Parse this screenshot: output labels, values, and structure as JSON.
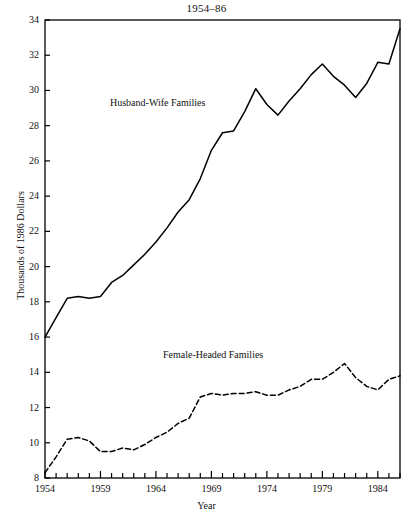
{
  "chart_data": {
    "type": "line",
    "title": "1954–86",
    "xlabel": "Year",
    "ylabel": "Thousands of 1986 Dollars",
    "xlim": [
      1954,
      1986
    ],
    "ylim": [
      8,
      34
    ],
    "yticks": [
      8,
      10,
      12,
      14,
      16,
      18,
      20,
      22,
      24,
      26,
      28,
      30,
      32,
      34
    ],
    "xticks_labeled": [
      1954,
      1959,
      1964,
      1969,
      1974,
      1979,
      1984
    ],
    "xtick_step_minor": 1,
    "grid": false,
    "legend_position": "inline-annotations",
    "axis_color": "#000000",
    "series": [
      {
        "name": "Husband-Wife Families",
        "style": "solid",
        "color": "#000000",
        "label_x": 1960,
        "label_y": 28.8,
        "x": [
          1954,
          1955,
          1956,
          1957,
          1958,
          1959,
          1960,
          1961,
          1962,
          1963,
          1964,
          1965,
          1966,
          1967,
          1968,
          1969,
          1970,
          1971,
          1972,
          1973,
          1974,
          1975,
          1976,
          1977,
          1978,
          1979,
          1980,
          1981,
          1982,
          1983,
          1984,
          1985,
          1986
        ],
        "values": [
          16.0,
          17.1,
          18.2,
          18.3,
          18.2,
          18.3,
          19.1,
          19.5,
          20.1,
          20.7,
          21.4,
          22.2,
          23.1,
          23.8,
          25.0,
          26.6,
          27.6,
          27.7,
          28.8,
          30.1,
          29.2,
          28.6,
          29.4,
          30.1,
          30.9,
          31.5,
          30.8,
          30.3,
          29.6,
          30.4,
          31.6,
          31.5,
          33.5
        ]
      },
      {
        "name": "Female-Headed Families",
        "style": "dashed",
        "color": "#000000",
        "label_x": 1965,
        "label_y": 15.0,
        "x": [
          1954,
          1955,
          1956,
          1957,
          1958,
          1959,
          1960,
          1961,
          1962,
          1963,
          1964,
          1965,
          1966,
          1967,
          1968,
          1969,
          1970,
          1971,
          1972,
          1973,
          1974,
          1975,
          1976,
          1977,
          1978,
          1979,
          1980,
          1981,
          1982,
          1983,
          1984,
          1985,
          1986
        ],
        "values": [
          8.3,
          9.2,
          10.2,
          10.3,
          10.1,
          9.5,
          9.5,
          9.7,
          9.6,
          9.9,
          10.3,
          10.6,
          11.1,
          11.4,
          12.6,
          12.8,
          12.7,
          12.8,
          12.8,
          12.9,
          12.7,
          12.7,
          13.0,
          13.2,
          13.6,
          13.6,
          14.0,
          14.5,
          13.7,
          13.2,
          13.0,
          13.6,
          13.8
        ]
      }
    ]
  }
}
